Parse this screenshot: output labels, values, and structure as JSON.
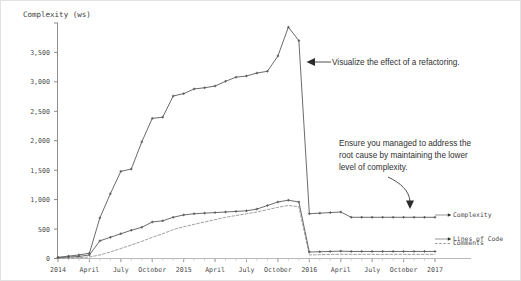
{
  "chart_data": {
    "type": "line",
    "title": "",
    "ylabel": "Complexity (ws)",
    "xlabel": "",
    "grid": false,
    "legend_position": "right-inline",
    "ylim": [
      0,
      4000
    ],
    "ytick_labels": [
      "0",
      "500",
      "1,000",
      "1,500",
      "2,000",
      "2,500",
      "3,000",
      "3,500"
    ],
    "ytick_values": [
      0,
      500,
      1000,
      1500,
      2000,
      2500,
      3000,
      3500
    ],
    "xtick_labels": [
      "2014",
      "April",
      "July",
      "October",
      "2015",
      "April",
      "July",
      "October",
      "2016",
      "April",
      "July",
      "October",
      "2017"
    ],
    "x": [
      "2014-01",
      "2014-02",
      "2014-03",
      "2014-04",
      "2014-05",
      "2014-06",
      "2014-07",
      "2014-08",
      "2014-09",
      "2014-10",
      "2014-11",
      "2014-12",
      "2015-01",
      "2015-02",
      "2015-03",
      "2015-04",
      "2015-05",
      "2015-06",
      "2015-07",
      "2015-08",
      "2015-09",
      "2015-10",
      "2015-11",
      "2015-12",
      "2016-01",
      "2016-02",
      "2016-03",
      "2016-04",
      "2016-05",
      "2016-06",
      "2016-07",
      "2016-08",
      "2016-09",
      "2016-10",
      "2016-11",
      "2016-12",
      "2017-01"
    ],
    "series": [
      {
        "name": "Complexity",
        "style": "solid",
        "color": "#5a5a5a",
        "values": [
          20,
          40,
          60,
          90,
          690,
          1100,
          1480,
          1520,
          1980,
          2380,
          2400,
          2760,
          2800,
          2880,
          2900,
          2930,
          3010,
          3080,
          3100,
          3150,
          3180,
          3440,
          3930,
          3700,
          760,
          770,
          780,
          790,
          700,
          700,
          700,
          700,
          700,
          700,
          700,
          700,
          700
        ]
      },
      {
        "name": "Lines of Code",
        "style": "solid",
        "color": "#5a5a5a",
        "values": [
          15,
          25,
          35,
          60,
          300,
          360,
          420,
          480,
          530,
          620,
          640,
          700,
          740,
          760,
          770,
          780,
          790,
          800,
          810,
          840,
          900,
          960,
          990,
          960,
          110,
          115,
          120,
          125,
          120,
          120,
          120,
          120,
          120,
          120,
          120,
          120,
          120
        ]
      },
      {
        "name": "Comments",
        "style": "dashed",
        "color": "#8e8e8e",
        "values": [
          5,
          10,
          15,
          25,
          60,
          110,
          170,
          230,
          290,
          360,
          420,
          490,
          540,
          580,
          620,
          660,
          700,
          730,
          760,
          790,
          830,
          870,
          900,
          880,
          60,
          65,
          70,
          72,
          70,
          70,
          70,
          70,
          70,
          70,
          70,
          70,
          70
        ]
      }
    ],
    "annotations": [
      {
        "id": "refactoring-note",
        "text": "Visualize the effect of a refactoring.",
        "arrow": "left"
      },
      {
        "id": "root-cause-note",
        "line1": "Ensure you managed to address the",
        "line2": "root cause by maintaining the lower",
        "line3": "level of complexity.",
        "arrow": "down-curved"
      }
    ],
    "series_labels": [
      "Complexity",
      "Lines of Code",
      "Comments"
    ]
  }
}
